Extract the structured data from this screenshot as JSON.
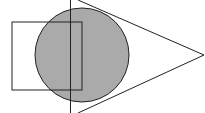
{
  "diagram": {
    "background": "#ffffff",
    "stroke_color": "#222222",
    "fill_color": "#aaaaaa",
    "shapes": {
      "circle": {
        "cx": 82,
        "cy": 55,
        "r": 47
      },
      "rectangle": {
        "x": 12,
        "y": 22,
        "width": 70,
        "height": 68
      },
      "vertical_line": {
        "x": 70,
        "y1": 0,
        "y2": 113
      },
      "triangle": {
        "apex_x": 204,
        "apex_y": 55,
        "top_x": 78,
        "top_y": 0,
        "bottom_x": 78,
        "bottom_y": 113
      }
    }
  }
}
